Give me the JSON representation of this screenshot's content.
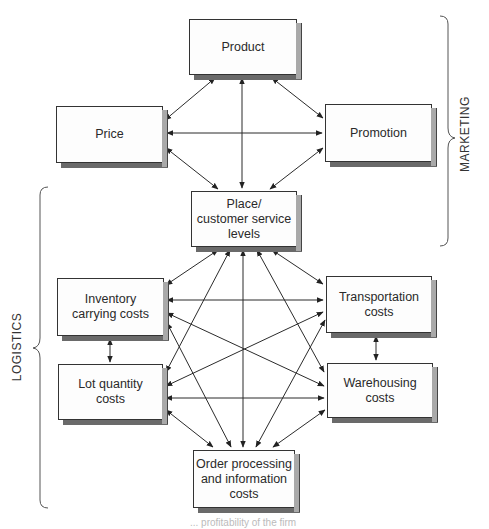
{
  "diagram": {
    "nodes": {
      "product": "Product",
      "price": "Price",
      "promotion": "Promotion",
      "place": "Place/\ncustomer service\nlevels",
      "inventory": "Inventory\ncarrying costs",
      "transportation": "Transportation\ncosts",
      "lot_quantity": "Lot quantity\ncosts",
      "warehousing": "Warehousing\ncosts",
      "order_processing": "Order processing\nand information\ncosts"
    },
    "groups": {
      "marketing": "MARKETING",
      "logistics": "LOGISTICS"
    },
    "edges": [
      [
        "product",
        "price"
      ],
      [
        "product",
        "promotion"
      ],
      [
        "product",
        "place"
      ],
      [
        "price",
        "promotion"
      ],
      [
        "price",
        "place"
      ],
      [
        "promotion",
        "place"
      ],
      [
        "place",
        "inventory"
      ],
      [
        "place",
        "transportation"
      ],
      [
        "place",
        "lot_quantity"
      ],
      [
        "place",
        "warehousing"
      ],
      [
        "place",
        "order_processing"
      ],
      [
        "inventory",
        "transportation"
      ],
      [
        "inventory",
        "warehousing"
      ],
      [
        "inventory",
        "lot_quantity"
      ],
      [
        "inventory",
        "order_processing"
      ],
      [
        "transportation",
        "warehousing"
      ],
      [
        "transportation",
        "lot_quantity"
      ],
      [
        "transportation",
        "order_processing"
      ],
      [
        "lot_quantity",
        "warehousing"
      ],
      [
        "lot_quantity",
        "order_processing"
      ],
      [
        "warehousing",
        "order_processing"
      ]
    ],
    "caption_fragment": "... profitability of the firm"
  },
  "colors": {
    "line": "#2b2b2b",
    "box_side": "#a9a9a9",
    "box_bottom": "#6a6a6a"
  }
}
